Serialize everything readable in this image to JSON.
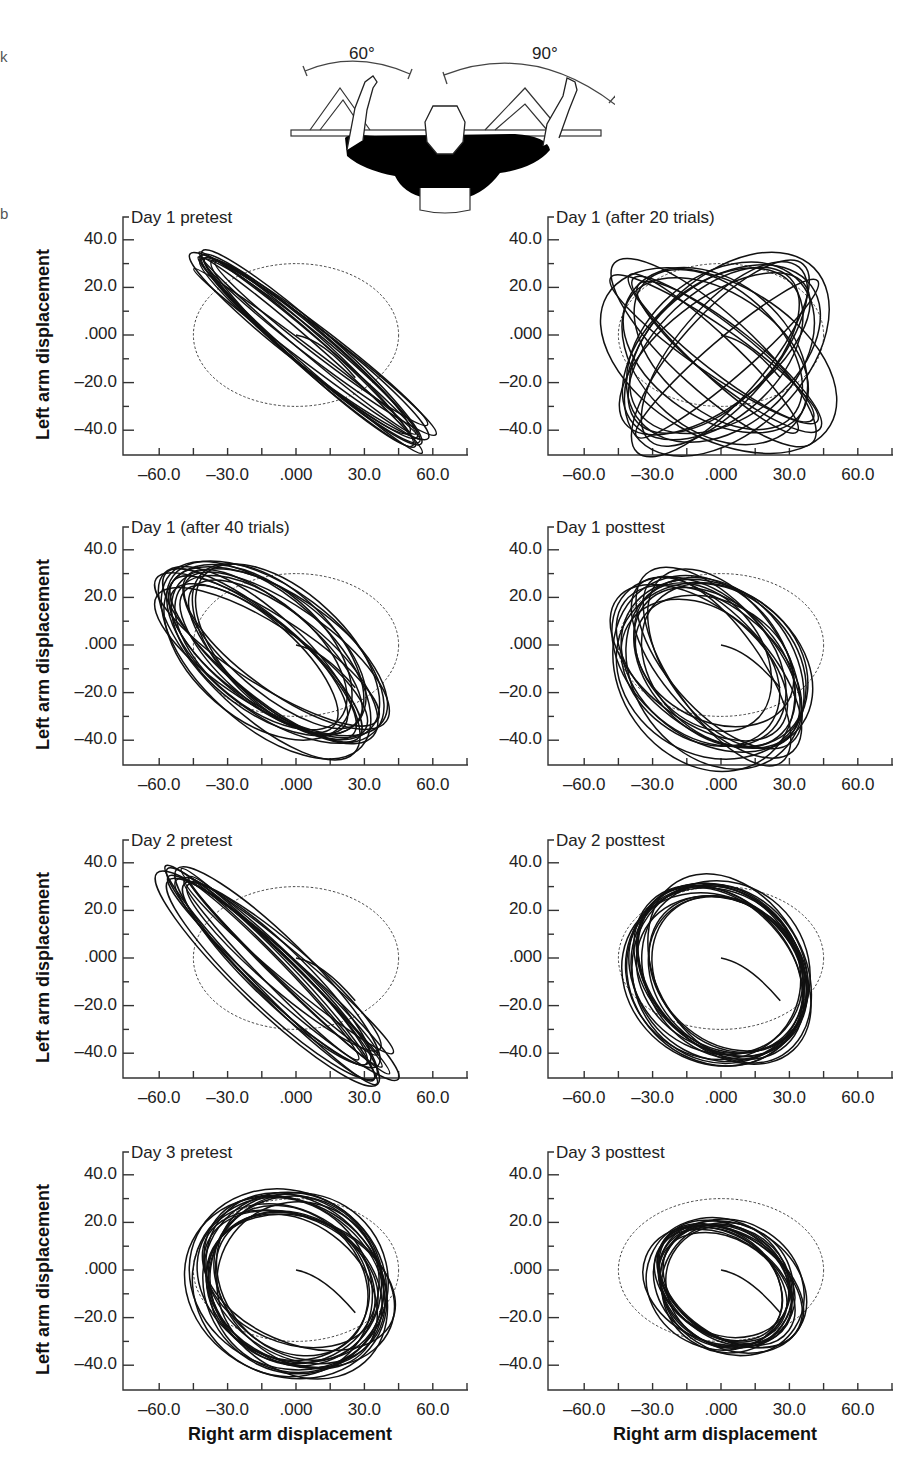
{
  "figure": {
    "margin_marks": [
      "k",
      "b"
    ],
    "illustration": {
      "left_angle_label": "60°",
      "right_angle_label": "90°"
    }
  },
  "axes": {
    "ylabel": "Left arm displacement",
    "xlabel": "Right arm displacement",
    "xticks": [
      "–60.0",
      "–30.0",
      ".000",
      "30.0",
      "60.0"
    ],
    "yticks": [
      "40.0",
      "20.0",
      ".000",
      "–20.0",
      "–40.0"
    ]
  },
  "panels": [
    {
      "title": "Day 1 pretest",
      "left": 0,
      "top": 205,
      "show_ylabel": true,
      "show_xlabel": false
    },
    {
      "title": "Day 1 (after 20 trials)",
      "left": 425,
      "top": 205,
      "show_ylabel": false,
      "show_xlabel": false
    },
    {
      "title": "Day 1 (after 40 trials)",
      "left": 0,
      "top": 515,
      "show_ylabel": true,
      "show_xlabel": false
    },
    {
      "title": "Day 1 posttest",
      "left": 425,
      "top": 515,
      "show_ylabel": false,
      "show_xlabel": false
    },
    {
      "title": "Day 2 pretest",
      "left": 0,
      "top": 828,
      "show_ylabel": true,
      "show_xlabel": false
    },
    {
      "title": "Day 2 posttest",
      "left": 425,
      "top": 828,
      "show_ylabel": false,
      "show_xlabel": false
    },
    {
      "title": "Day 3 pretest",
      "left": 0,
      "top": 1140,
      "show_ylabel": true,
      "show_xlabel": true
    },
    {
      "title": "Day 3 posttest",
      "left": 425,
      "top": 1140,
      "show_ylabel": false,
      "show_xlabel": true
    }
  ],
  "chart_data": [
    {
      "type": "scatter",
      "title": "Day 1 pretest",
      "xlabel": "Right arm displacement",
      "ylabel": "Left arm displacement",
      "xlim": [
        -75,
        75
      ],
      "ylim": [
        -50,
        50
      ],
      "reference_ellipse": {
        "cx": 0,
        "cy": 0,
        "rx": 45,
        "ry": 30,
        "rotation_deg": 0,
        "style": "dashed",
        "phase_target": "90° relative phase"
      },
      "trajectory": {
        "pattern": "anti-phase diagonal (≈180°)",
        "cx": 8,
        "cy": -6,
        "rx_major": 60,
        "rx_minor": 4,
        "angle_deg": -37,
        "loops": 12
      }
    },
    {
      "type": "scatter",
      "title": "Day 1 (after 20 trials)",
      "xlabel": "Right arm displacement",
      "ylabel": "Left arm displacement",
      "xlim": [
        -75,
        75
      ],
      "ylim": [
        -50,
        50
      ],
      "reference_ellipse": {
        "cx": 0,
        "cy": 0,
        "rx": 45,
        "ry": 30,
        "rotation_deg": 0,
        "style": "dashed"
      },
      "trajectory": {
        "pattern": "mixed / drifting phase",
        "cx": 0,
        "cy": -8,
        "extent_x": [
          -50,
          48
        ],
        "extent_y": [
          -50,
          32
        ],
        "loops": 18
      }
    },
    {
      "type": "scatter",
      "title": "Day 1 (after 40 trials)",
      "xlabel": "Right arm displacement",
      "ylabel": "Left arm displacement",
      "xlim": [
        -75,
        75
      ],
      "ylim": [
        -50,
        50
      ],
      "reference_ellipse": {
        "cx": 0,
        "cy": 0,
        "rx": 45,
        "ry": 30,
        "rotation_deg": 0,
        "style": "dashed"
      },
      "trajectory": {
        "pattern": "broad diagonal ellipses",
        "cx": -8,
        "cy": -6,
        "extent_x": [
          -68,
          48
        ],
        "extent_y": [
          -50,
          46
        ],
        "loops": 18
      }
    },
    {
      "type": "scatter",
      "title": "Day 1 posttest",
      "xlabel": "Right arm displacement",
      "ylabel": "Left arm displacement",
      "xlim": [
        -75,
        75
      ],
      "ylim": [
        -50,
        50
      ],
      "reference_ellipse": {
        "cx": 0,
        "cy": 0,
        "rx": 45,
        "ry": 30,
        "rotation_deg": 0,
        "style": "dashed"
      },
      "trajectory": {
        "pattern": "wide ellipses approaching target",
        "cx": -5,
        "cy": -8,
        "extent_x": [
          -55,
          48
        ],
        "extent_y": [
          -50,
          34
        ],
        "loops": 16
      }
    },
    {
      "type": "scatter",
      "title": "Day 2 pretest",
      "xlabel": "Right arm displacement",
      "ylabel": "Left arm displacement",
      "xlim": [
        -75,
        75
      ],
      "ylim": [
        -50,
        50
      ],
      "reference_ellipse": {
        "cx": 0,
        "cy": 0,
        "rx": 45,
        "ry": 30,
        "rotation_deg": 0,
        "style": "dashed"
      },
      "trajectory": {
        "pattern": "anti-phase diagonal (≈180°)",
        "cx": -10,
        "cy": -6,
        "extent_x": [
          -66,
          50
        ],
        "extent_y": [
          -50,
          40
        ],
        "loops": 14
      }
    },
    {
      "type": "scatter",
      "title": "Day 2 posttest",
      "xlabel": "Right arm displacement",
      "ylabel": "Left arm displacement",
      "xlim": [
        -75,
        75
      ],
      "ylim": [
        -50,
        50
      ],
      "reference_ellipse": {
        "cx": 0,
        "cy": 0,
        "rx": 45,
        "ry": 30,
        "rotation_deg": 0,
        "style": "dashed"
      },
      "trajectory": {
        "pattern": "near-circular loops (≈90°)",
        "cx": 0,
        "cy": -6,
        "extent_x": [
          -52,
          52
        ],
        "extent_y": [
          -50,
          38
        ],
        "loops": 16
      }
    },
    {
      "type": "scatter",
      "title": "Day 3 pretest",
      "xlabel": "Right arm displacement",
      "ylabel": "Left arm displacement",
      "xlim": [
        -75,
        75
      ],
      "ylim": [
        -50,
        50
      ],
      "reference_ellipse": {
        "cx": 0,
        "cy": 0,
        "rx": 45,
        "ry": 30,
        "rotation_deg": 0,
        "style": "dashed"
      },
      "trajectory": {
        "pattern": "near-circular loops (≈90°)",
        "cx": -2,
        "cy": -6,
        "extent_x": [
          -52,
          50
        ],
        "extent_y": [
          -50,
          38
        ],
        "loops": 18
      }
    },
    {
      "type": "scatter",
      "title": "Day 3 posttest",
      "xlabel": "Right arm displacement",
      "ylabel": "Left arm displacement",
      "xlim": [
        -75,
        75
      ],
      "ylim": [
        -50,
        50
      ],
      "reference_ellipse": {
        "cx": 0,
        "cy": 0,
        "rx": 45,
        "ry": 30,
        "rotation_deg": 0,
        "style": "dashed"
      },
      "trajectory": {
        "pattern": "tight ellipses matching target (≈90°)",
        "cx": 2,
        "cy": -6,
        "extent_x": [
          -40,
          48
        ],
        "extent_y": [
          -40,
          28
        ],
        "loops": 16
      }
    }
  ]
}
